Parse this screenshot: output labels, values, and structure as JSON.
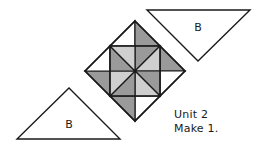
{
  "figure": {
    "kind": "quilt-block-assembly-diagram",
    "caption": {
      "unit_line": "Unit 2",
      "make_line": "Make 1."
    },
    "colors": {
      "outline": "#1a1a1a",
      "background": "#ffffff",
      "dark_gray": "#9a9a9a",
      "light_gray": "#cfcfcf",
      "white_patch": "#ffffff",
      "text": "#1a1a1a"
    },
    "patch_labels": {
      "top_right_triangle": "B",
      "bottom_left_triangle": "B"
    },
    "block": {
      "shape": "square-on-point",
      "center_x": 135,
      "center_y": 71,
      "half_diagonal": 50,
      "pattern": "pinwheel"
    },
    "triangles": [
      {
        "name": "triangle-b-top-right",
        "label": "B",
        "orientation": "point-down",
        "fill": "#ffffff",
        "points": "147,10 250,10 198,61"
      },
      {
        "name": "triangle-b-bottom-left",
        "label": "B",
        "orientation": "point-up",
        "fill": "#ffffff",
        "points": "17,139 120,139 69,88"
      }
    ]
  }
}
